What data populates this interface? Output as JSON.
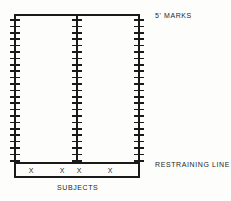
{
  "diagram": {
    "title_label": "5' MARKS",
    "restraining_label": "RESTRAINING  LINE",
    "subjects_label": "SUBJECTS",
    "subject_marker": "X",
    "colors": {
      "line": "#1a1a1a",
      "background": "#fdfdfc",
      "text": "#262626"
    },
    "geometry": {
      "top_line_y": 15,
      "restraining_line_y": 163,
      "box_bottom_y": 177,
      "left_x": 15,
      "middle_x": 77,
      "right_x": 139,
      "tick_count": 23,
      "tick_spacing": 6.4,
      "tick_half_width": 5
    },
    "lanes": [
      {
        "name": "left-lane",
        "x": 15,
        "ticks": 23
      },
      {
        "name": "middle-lane",
        "x": 77,
        "ticks": 23
      },
      {
        "name": "right-lane",
        "x": 139,
        "ticks": 23
      }
    ],
    "subjects": [
      {
        "id": "subject-1",
        "marker": "X",
        "x": 31,
        "y": 170
      },
      {
        "id": "subject-2",
        "marker": "X",
        "x": 62,
        "y": 170
      },
      {
        "id": "subject-3",
        "marker": "X",
        "x": 79,
        "y": 170
      },
      {
        "id": "subject-4",
        "marker": "X",
        "x": 110,
        "y": 170
      }
    ]
  }
}
